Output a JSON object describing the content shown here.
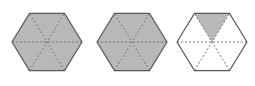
{
  "figure": {
    "background_color": "#ffffff",
    "width": 255,
    "height": 86,
    "shaded_color": "#b8b8b8",
    "unshaded_color": "#ffffff",
    "outline_color": "#5a5a5a",
    "divider_color": "#6e6e6e",
    "outline_width": 1.2,
    "divider_width": 0.9,
    "divider_dash": "2.2,1.8",
    "sector_count": 6,
    "shapes": [
      {
        "name": "hexagon-1",
        "center_x": 47,
        "center_y": 42,
        "radius_x": 35,
        "radius_y": 33,
        "shaded_sectors": [
          0,
          1,
          2,
          3,
          4,
          5
        ],
        "shaded_count": 6,
        "fraction_label": "6/6"
      },
      {
        "name": "hexagon-2",
        "center_x": 132,
        "center_y": 42,
        "radius_x": 35,
        "radius_y": 33,
        "shaded_sectors": [
          0,
          1,
          2,
          3,
          4,
          5
        ],
        "shaded_count": 6,
        "fraction_label": "6/6"
      },
      {
        "name": "hexagon-3",
        "center_x": 212,
        "center_y": 42,
        "radius_x": 35,
        "radius_y": 33,
        "shaded_sectors": [
          4
        ],
        "shaded_count": 1,
        "fraction_label": "1/6"
      }
    ]
  }
}
